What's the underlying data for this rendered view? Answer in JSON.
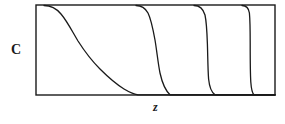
{
  "figure": {
    "kind": "line-plot-sketch",
    "background_color": "#ffffff",
    "line_color": "#1a1a1a",
    "frame": {
      "x": 36,
      "y": 5,
      "width": 239,
      "height": 90,
      "stroke_width": 1.4,
      "fill": "#ffffff"
    },
    "y_axis": {
      "label": "C"
    },
    "x_axis": {
      "label": "z"
    }
  },
  "chart_data": {
    "type": "line",
    "title": "",
    "xlabel": "z",
    "ylabel": "C",
    "grid": false,
    "legend": null,
    "xlim": [
      0,
      1
    ],
    "ylim": [
      0,
      1
    ],
    "x_tick_labels": [],
    "y_tick_labels": [],
    "series": [
      {
        "name": "curve-1",
        "steepness": "gradual",
        "top_departure_x": 52,
        "bottom_arrival_x": 133,
        "points": [
          [
            36,
            5
          ],
          [
            45,
            5
          ],
          [
            52,
            6
          ],
          [
            58,
            10
          ],
          [
            64,
            17
          ],
          [
            70,
            26
          ],
          [
            77,
            37
          ],
          [
            84,
            48
          ],
          [
            92,
            58
          ],
          [
            100,
            67
          ],
          [
            108,
            75
          ],
          [
            116,
            82
          ],
          [
            124,
            88
          ],
          [
            131,
            93
          ],
          [
            137,
            95
          ],
          [
            150,
            95
          ],
          [
            275,
            95
          ]
        ]
      },
      {
        "name": "curve-2",
        "steepness": "moderate",
        "top_departure_x": 140,
        "bottom_arrival_x": 170,
        "points": [
          [
            136,
            5
          ],
          [
            141,
            6
          ],
          [
            145,
            10
          ],
          [
            149,
            17
          ],
          [
            152,
            26
          ],
          [
            155,
            38
          ],
          [
            157,
            50
          ],
          [
            159,
            62
          ],
          [
            161,
            73
          ],
          [
            164,
            83
          ],
          [
            167,
            91
          ],
          [
            170,
            95
          ],
          [
            275,
            95
          ]
        ]
      },
      {
        "name": "curve-3",
        "steepness": "steep",
        "top_departure_x": 198,
        "bottom_arrival_x": 214,
        "points": [
          [
            194,
            5
          ],
          [
            198,
            6
          ],
          [
            202,
            11
          ],
          [
            205,
            19
          ],
          [
            206,
            30
          ],
          [
            207,
            42
          ],
          [
            208,
            55
          ],
          [
            208,
            67
          ],
          [
            209,
            78
          ],
          [
            211,
            88
          ],
          [
            214,
            95
          ],
          [
            275,
            95
          ]
        ]
      },
      {
        "name": "curve-4",
        "steepness": "near-vertical",
        "top_departure_x": 244,
        "bottom_arrival_x": 252,
        "points": [
          [
            242,
            5
          ],
          [
            245,
            6
          ],
          [
            248,
            10
          ],
          [
            249,
            18
          ],
          [
            250,
            30
          ],
          [
            250,
            45
          ],
          [
            250,
            60
          ],
          [
            250,
            74
          ],
          [
            251,
            86
          ],
          [
            253,
            95
          ],
          [
            275,
            95
          ]
        ]
      }
    ]
  }
}
